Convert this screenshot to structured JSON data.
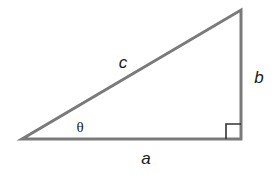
{
  "diagram": {
    "type": "right-triangle",
    "line_color": "#7a7a7a",
    "line_width": 3,
    "vertices": {
      "left": {
        "x": 22,
        "y": 139
      },
      "right_angle": {
        "x": 241,
        "y": 139
      },
      "top": {
        "x": 241,
        "y": 10
      }
    },
    "right_angle_marker": {
      "x": 226,
      "y": 124,
      "size": 15
    },
    "labels": {
      "hypotenuse": {
        "text": "c",
        "x": 123,
        "y": 62
      },
      "opposite": {
        "text": "b",
        "x": 259,
        "y": 77
      },
      "adjacent": {
        "text": "a",
        "x": 146,
        "y": 158
      },
      "angle": {
        "text": "θ",
        "x": 80,
        "y": 127
      }
    }
  }
}
